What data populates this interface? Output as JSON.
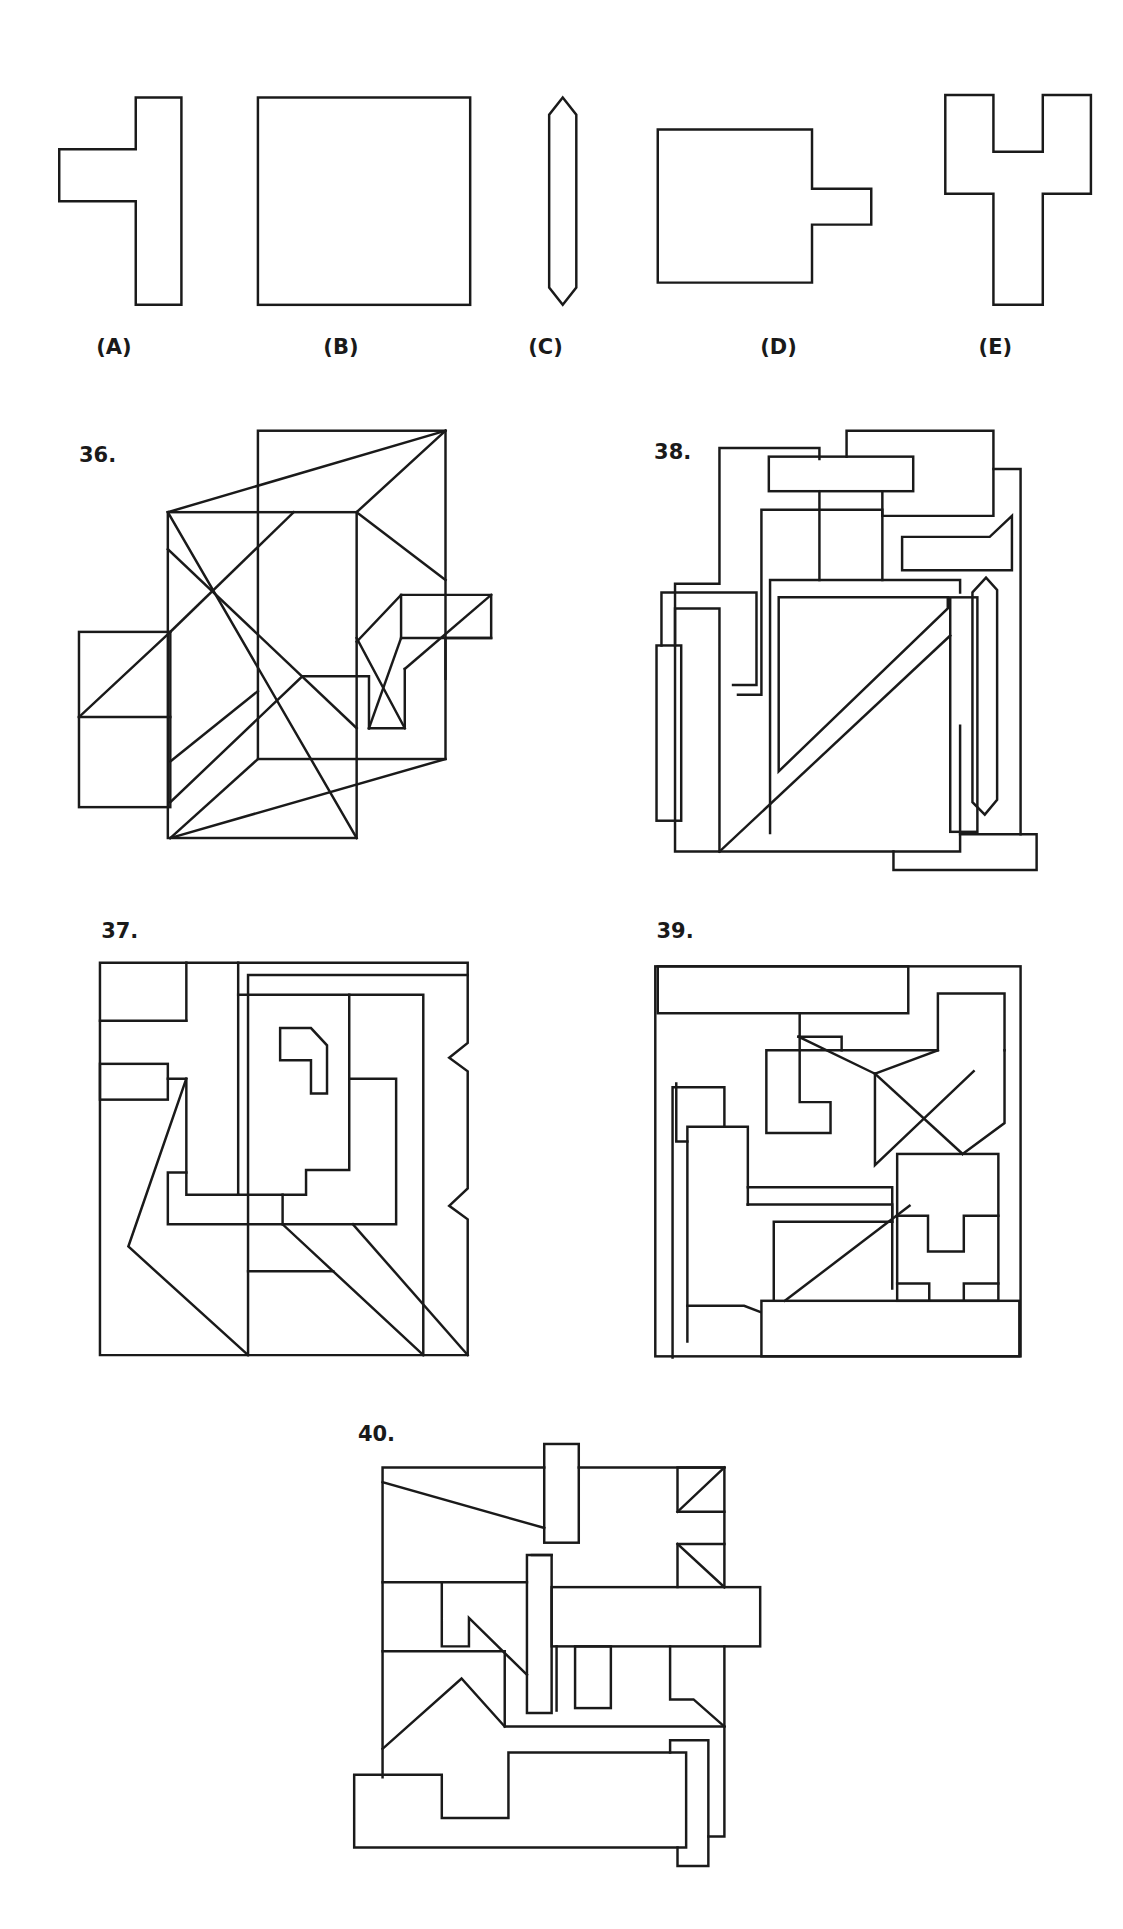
{
  "answer_choices": [
    {
      "id": "A",
      "label": "(A)",
      "shape": "T-shaped piece (vertical bar with left arm)"
    },
    {
      "id": "B",
      "label": "(B)",
      "shape": "rectangle"
    },
    {
      "id": "C",
      "label": "(C)",
      "shape": "thin elongated hexagon"
    },
    {
      "id": "D",
      "label": "(D)",
      "shape": "square with right tab"
    },
    {
      "id": "E",
      "label": "(E)",
      "shape": "Y/fork-shaped piece"
    }
  ],
  "questions": [
    {
      "number": "36.",
      "label": "36."
    },
    {
      "number": "37.",
      "label": "37."
    },
    {
      "number": "38.",
      "label": "38."
    },
    {
      "number": "39.",
      "label": "39."
    },
    {
      "number": "40.",
      "label": "40."
    }
  ],
  "colors": {
    "stroke": "#1a1a1a",
    "background": "#ffffff"
  }
}
